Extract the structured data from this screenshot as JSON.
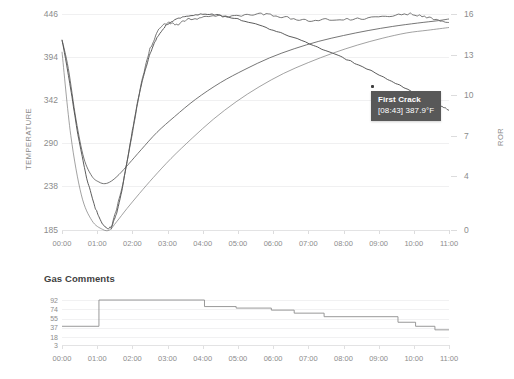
{
  "chart_data": [
    {
      "id": "roast-profile",
      "type": "line",
      "title": "",
      "xlabel": "",
      "ylabel": "TEMPERATURE",
      "y2label": "ROR",
      "xtick_labels": [
        "00:00",
        "01:00",
        "02:00",
        "03:00",
        "04:00",
        "05:00",
        "06:00",
        "07:00",
        "08:00",
        "09:00",
        "10:00",
        "11:00"
      ],
      "ytick_labels": [
        "446",
        "394",
        "342",
        "290",
        "238",
        "185"
      ],
      "ylim": [
        185,
        446
      ],
      "y2tick_labels": [
        "16",
        "13",
        "10",
        "7",
        "4",
        "0"
      ],
      "y2lim": [
        0,
        16
      ],
      "grid": true,
      "legend": "none",
      "annotations": [
        {
          "name": "First Crack",
          "time": "[08:43]",
          "value": "387.9°F",
          "label_line1": "First Crack",
          "label_line2": "[08:43] 387.9°F"
        }
      ],
      "series": [
        {
          "name": "bean-temperature",
          "axis": "left",
          "color": "#5d5d5d",
          "points": [
            [
              0.0,
              415
            ],
            [
              0.18,
              380
            ],
            [
              0.4,
              318
            ],
            [
              0.62,
              272
            ],
            [
              0.85,
              250
            ],
            [
              1.05,
              243
            ],
            [
              1.22,
              241
            ],
            [
              1.4,
              244
            ],
            [
              1.62,
              252
            ],
            [
              1.9,
              265
            ],
            [
              2.25,
              282
            ],
            [
              2.7,
              303
            ],
            [
              3.2,
              322
            ],
            [
              3.8,
              343
            ],
            [
              4.5,
              363
            ],
            [
              5.2,
              379
            ],
            [
              5.9,
              393
            ],
            [
              6.6,
              404
            ],
            [
              7.3,
              413
            ],
            [
              8.0,
              420
            ],
            [
              8.7,
              426
            ],
            [
              9.4,
              431
            ],
            [
              10.1,
              435
            ],
            [
              10.7,
              438
            ],
            [
              11.0,
              440
            ]
          ]
        },
        {
          "name": "environment-temperature",
          "axis": "left",
          "color": "#4a4a4a",
          "points": [
            [
              0.0,
              415
            ],
            [
              0.2,
              368
            ],
            [
              0.45,
              300
            ],
            [
              0.7,
              248
            ],
            [
              0.95,
              211
            ],
            [
              1.15,
              192
            ],
            [
              1.3,
              186
            ],
            [
              1.42,
              190
            ],
            [
              1.55,
              205
            ],
            [
              1.7,
              232
            ],
            [
              1.85,
              268
            ],
            [
              2.0,
              305
            ],
            [
              2.15,
              340
            ],
            [
              2.3,
              368
            ],
            [
              2.5,
              398
            ],
            [
              2.7,
              418
            ],
            [
              2.95,
              432
            ],
            [
              3.25,
              440
            ],
            [
              3.6,
              444
            ],
            [
              4.0,
              446
            ],
            [
              4.4,
              445
            ],
            [
              4.9,
              441
            ],
            [
              5.5,
              434
            ],
            [
              6.1,
              425
            ],
            [
              6.8,
              414
            ],
            [
              7.5,
              402
            ],
            [
              8.2,
              389
            ],
            [
              8.9,
              375
            ],
            [
              9.6,
              360
            ],
            [
              10.3,
              345
            ],
            [
              10.7,
              336
            ],
            [
              11.0,
              330
            ]
          ]
        },
        {
          "name": "rate-of-rise",
          "axis": "right",
          "color": "#7a7a7a",
          "points": [
            [
              0.0,
              13.2
            ],
            [
              0.25,
              7.0
            ],
            [
              0.55,
              2.6
            ],
            [
              0.85,
              0.7
            ],
            [
              1.15,
              0.05
            ],
            [
              1.35,
              0.0
            ],
            [
              1.55,
              0.6
            ],
            [
              1.85,
              1.6
            ],
            [
              2.2,
              2.7
            ],
            [
              2.6,
              3.9
            ],
            [
              3.1,
              5.3
            ],
            [
              3.7,
              6.8
            ],
            [
              4.3,
              8.2
            ],
            [
              4.95,
              9.5
            ],
            [
              5.6,
              10.6
            ],
            [
              6.3,
              11.6
            ],
            [
              7.0,
              12.4
            ],
            [
              7.7,
              13.1
            ],
            [
              8.4,
              13.7
            ],
            [
              9.1,
              14.2
            ],
            [
              9.8,
              14.6
            ],
            [
              10.4,
              14.8
            ],
            [
              11.0,
              15.0
            ]
          ]
        },
        {
          "name": "delta-temperature",
          "axis": "right",
          "color": "#5d5d5d",
          "points": [
            [
              1.4,
              0.1
            ],
            [
              1.7,
              3.0
            ],
            [
              2.0,
              7.2
            ],
            [
              2.25,
              10.9
            ],
            [
              2.5,
              13.4
            ],
            [
              2.75,
              14.9
            ],
            [
              3.0,
              15.4
            ],
            [
              3.25,
              15.2
            ],
            [
              3.55,
              15.6
            ],
            [
              3.9,
              15.7
            ],
            [
              4.3,
              15.9
            ],
            [
              4.7,
              15.8
            ],
            [
              5.1,
              15.9
            ],
            [
              5.6,
              16.0
            ],
            [
              6.0,
              15.9
            ],
            [
              6.5,
              15.7
            ],
            [
              7.0,
              15.5
            ],
            [
              7.6,
              15.6
            ],
            [
              8.2,
              15.6
            ],
            [
              8.8,
              15.7
            ],
            [
              9.4,
              15.9
            ],
            [
              9.9,
              16.0
            ],
            [
              10.3,
              15.8
            ],
            [
              10.7,
              15.5
            ],
            [
              11.0,
              15.4
            ]
          ]
        }
      ]
    },
    {
      "id": "gas-comments",
      "type": "line",
      "title": "Gas Comments",
      "xlabel": "",
      "ylabel": "",
      "xtick_labels": [
        "00:00",
        "01:00",
        "02:00",
        "03:00",
        "04:00",
        "05:00",
        "06:00",
        "07:00",
        "08:00",
        "09:00",
        "10:00",
        "11:00"
      ],
      "ytick_labels": [
        "92",
        "74",
        "55",
        "37",
        "18",
        "3"
      ],
      "ylim": [
        3,
        92
      ],
      "grid": true,
      "legend": "none",
      "series": [
        {
          "name": "gas-setting",
          "color": "#8d8d8d",
          "step": "post",
          "points": [
            [
              0.0,
              40
            ],
            [
              1.05,
              40
            ],
            [
              1.05,
              92
            ],
            [
              4.05,
              92
            ],
            [
              4.05,
              79
            ],
            [
              4.95,
              79
            ],
            [
              4.95,
              76
            ],
            [
              5.95,
              76
            ],
            [
              5.95,
              72
            ],
            [
              6.6,
              72
            ],
            [
              6.6,
              66
            ],
            [
              7.45,
              66
            ],
            [
              7.45,
              59
            ],
            [
              9.55,
              59
            ],
            [
              9.55,
              48
            ],
            [
              10.05,
              48
            ],
            [
              10.05,
              40
            ],
            [
              10.6,
              40
            ],
            [
              10.6,
              33
            ],
            [
              11.0,
              33
            ]
          ]
        }
      ]
    }
  ],
  "main_chart": {
    "y_axis_label": "TEMPERATURE",
    "y2_axis_label": "ROR",
    "y_ticks": [
      "446",
      "394",
      "342",
      "290",
      "238",
      "185"
    ],
    "y2_ticks": [
      "16",
      "13",
      "10",
      "7",
      "4",
      "0"
    ],
    "x_ticks": [
      "00:00",
      "01:00",
      "02:00",
      "03:00",
      "04:00",
      "05:00",
      "06:00",
      "07:00",
      "08:00",
      "09:00",
      "10:00",
      "11:00"
    ]
  },
  "tooltip": {
    "title": "First Crack",
    "detail": "[08:43] 387.9°F"
  },
  "gas_chart": {
    "title": "Gas Comments",
    "y_ticks": [
      "92",
      "74",
      "55",
      "37",
      "18",
      "3"
    ],
    "x_ticks": [
      "00:00",
      "01:00",
      "02:00",
      "03:00",
      "04:00",
      "05:00",
      "06:00",
      "07:00",
      "08:00",
      "09:00",
      "10:00",
      "11:00"
    ]
  },
  "colors": {
    "background": "#ffffff",
    "grid": "#f0f0f1",
    "axis_text": "#8c8c8c",
    "curve": "#5d5d5d",
    "tooltip_bg": "#585858",
    "tooltip_text": "#ffffff"
  }
}
